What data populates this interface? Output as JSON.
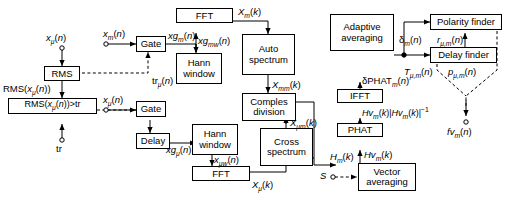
{
  "diagram": {
    "width": 507,
    "height": 201,
    "blocks": [
      {
        "id": "rms",
        "label": "RMS"
      },
      {
        "id": "rms_thresh",
        "label": "RMS(xμ(n))>tr"
      },
      {
        "id": "gate_m",
        "label": "Gate"
      },
      {
        "id": "gate_mu",
        "label": "Gate"
      },
      {
        "id": "delay",
        "label": "Delay"
      },
      {
        "id": "fft_top",
        "label": "FFT"
      },
      {
        "id": "hann_top",
        "label": "Hann window"
      },
      {
        "id": "hann_bot",
        "label": "Hann window"
      },
      {
        "id": "fft_bot",
        "label": "FFT"
      },
      {
        "id": "auto_spectrum",
        "label": "Auto spectrum"
      },
      {
        "id": "complex_division",
        "label": "Comples division"
      },
      {
        "id": "cross_spectrum",
        "label": "Cross spectrum"
      },
      {
        "id": "adaptive_averaging",
        "label": "Adaptive averaging"
      },
      {
        "id": "ifft",
        "label": "IFFT"
      },
      {
        "id": "phat",
        "label": "PHAT"
      },
      {
        "id": "vector_averaging",
        "label": "Vector averaging"
      },
      {
        "id": "polarity_finder",
        "label": "Polarity finder"
      },
      {
        "id": "delay_finder",
        "label": "Delay finder"
      }
    ],
    "labels": {
      "x_mu_in": "xμ(n)",
      "x_m_in": "xm(n)",
      "x_mu_gate_in": "xμ(n)",
      "rms_out": "RMS(xμ(n))",
      "tr_in": "tr",
      "tr_mu": "trμ(n)",
      "xg_m": "xgm(n)",
      "xg_mu": "xgμ(n)",
      "xg_mw": "xgmw(n)",
      "x_mu_w": "xμw(n)",
      "X_m_k": "Xm(k)",
      "X_mu_k": "Xμ(k)",
      "X_mm_k": "Xmm(k)",
      "X_mu_m_k": "Xμm(k)",
      "delta_phat_m": "δPHATm(n)",
      "Hv_norm": "Hvm(k)|Hvm(k)|⁻¹",
      "Hv_m_k": "Hvm(k)",
      "H_m_k": "Hm(k)",
      "S_in": "S",
      "delta_m": "δm(n)",
      "r_mu_m": "rμ,m(n)",
      "T_mu_m": "Tμ,m(n)",
      "p_mu_m": "pμ,m(n)",
      "fv_m": "fvm(n)"
    }
  }
}
